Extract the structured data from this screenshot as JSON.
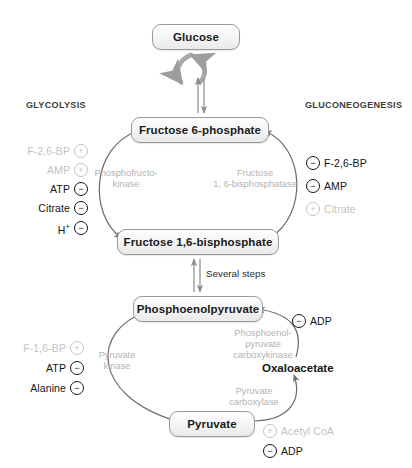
{
  "diagram": {
    "pathways": {
      "left": "GLYCOLYSIS",
      "right": "GLUCONEOGENESIS"
    },
    "metabolites": {
      "glucose": "Glucose",
      "f6p": "Fructose 6-phosphate",
      "fbp": "Fructose 1,6-bisphosphate",
      "pep": "Phosphoenolpyruvate",
      "pyruvate": "Pyruvate",
      "oxaloacetate": "Oxaloacetate"
    },
    "enzymes": {
      "pfk_line1": "Phosphofructo-",
      "pfk_line2": "kinase",
      "fbpase_line1": "Fructose",
      "fbpase_line2": "1, 6-bisphosphatase",
      "pk_line1": "Pyruvate",
      "pk_line2": "kinase",
      "pepck_line1": "Phosphoenol-",
      "pepck_line2": "pyruvate",
      "pepck_line3": "carboxykinase",
      "pc_line1": "Pyruvate",
      "pc_line2": "carboxylase"
    },
    "steps": {
      "several": "Several steps"
    },
    "regulators": {
      "pfk": [
        {
          "name": "F-2,6-BP",
          "sign": "+",
          "state": "inactive"
        },
        {
          "name": "AMP",
          "sign": "+",
          "state": "inactive"
        },
        {
          "name": "ATP",
          "sign": "−",
          "state": "active"
        },
        {
          "name": "Citrate",
          "sign": "−",
          "state": "active"
        },
        {
          "name": "H",
          "superscript": "+",
          "sign": "−",
          "state": "active"
        }
      ],
      "fbpase": [
        {
          "name": "F-2,6-BP",
          "sign": "−",
          "state": "active"
        },
        {
          "name": "AMP",
          "sign": "−",
          "state": "active"
        },
        {
          "name": "Citrate",
          "sign": "+",
          "state": "inactive"
        }
      ],
      "pyruvate_kinase": [
        {
          "name": "F-1,6-BP",
          "sign": "+",
          "state": "inactive"
        },
        {
          "name": "ATP",
          "sign": "−",
          "state": "active"
        },
        {
          "name": "Alanine",
          "sign": "−",
          "state": "active"
        }
      ],
      "pepck": [
        {
          "name": "ADP",
          "sign": "−",
          "state": "active"
        }
      ],
      "pyruvate_carboxylase": [
        {
          "name": "Acetyl CoA",
          "sign": "+",
          "state": "inactive"
        },
        {
          "name": "ADP",
          "sign": "−",
          "state": "active"
        }
      ]
    },
    "colors": {
      "active_text": "#141414",
      "inactive_text": "#c3c3c3",
      "enzyme_text": "#b3b3b3",
      "arrow": "#6e6e6e",
      "box_border": "#9a9a9a",
      "background": "#ffffff"
    }
  }
}
